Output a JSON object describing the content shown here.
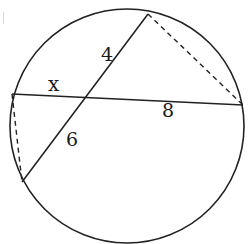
{
  "diagram": {
    "type": "intersecting-chords",
    "circle": {
      "cx": 127,
      "cy": 126,
      "r": 117
    },
    "chords": [
      {
        "id": "chord-a",
        "from": [
          148,
          14
        ],
        "to": [
          22,
          182
        ]
      },
      {
        "id": "chord-b",
        "from": [
          12,
          94
        ],
        "to": [
          243,
          105
        ]
      }
    ],
    "intersection": [
      87,
      97
    ],
    "dashed_segments": [
      {
        "id": "dash-right",
        "from": [
          148,
          14
        ],
        "to": [
          243,
          105
        ]
      },
      {
        "id": "dash-left",
        "from": [
          12,
          94
        ],
        "to": [
          22,
          182
        ]
      }
    ],
    "labels": {
      "x": {
        "text": "x",
        "pos": [
          48,
          91
        ]
      },
      "four": {
        "text": "4",
        "pos": [
          101,
          61
        ]
      },
      "eight": {
        "text": "8",
        "pos": [
          162,
          117
        ]
      },
      "six": {
        "text": "6",
        "pos": [
          66,
          146
        ]
      }
    },
    "colors": {
      "stroke": "#222222",
      "background": "#ffffff"
    }
  }
}
